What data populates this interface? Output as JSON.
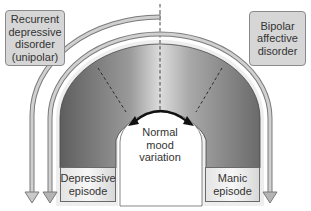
{
  "diagram": {
    "labels": {
      "unipolar": "Recurrent depressive disorder (unipolar)",
      "unipolar_lines": [
        "Recurrent",
        "depressive",
        "disorder",
        "(unipolar)"
      ],
      "bipolar": "Bipolar affective disorder",
      "bipolar_lines": [
        "Bipolar",
        "affective",
        "disorder"
      ],
      "normal": "Normal mood variation",
      "normal_lines": [
        "Normal",
        "mood",
        "variation"
      ],
      "depressive_episode_lines": [
        "Depressive",
        "episode"
      ],
      "manic_episode_lines": [
        "Manic",
        "episode"
      ]
    },
    "colors": {
      "band_dark": "#6e6e6e",
      "band_light": "#d9d9d9",
      "arrow_fill": "#c8c8c8",
      "arrow_stroke": "#7a7a7a",
      "box_fill": "#d6d6d6"
    }
  }
}
